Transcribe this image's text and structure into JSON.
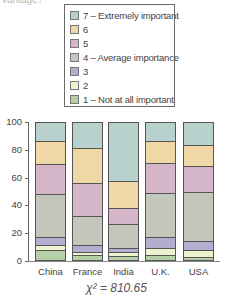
{
  "header": {
    "cut_text": "vantage?"
  },
  "legend": {
    "items": [
      {
        "label": "7 – Extremely important",
        "color": "#b9d1cc"
      },
      {
        "label": "6",
        "color": "#f0d8a6"
      },
      {
        "label": "5",
        "color": "#d5b6c8"
      },
      {
        "label": "4 – Average importance",
        "color": "#c3c6bb"
      },
      {
        "label": "3",
        "color": "#b3aed0"
      },
      {
        "label": "2",
        "color": "#eef2cf"
      },
      {
        "label": "1 – Not at all important",
        "color": "#b5d0a7"
      }
    ]
  },
  "yaxis": {
    "ticks": [
      "100",
      "80",
      "60",
      "40",
      "20",
      "0"
    ]
  },
  "footer": {
    "statistic": "χ² = 810.65"
  },
  "chart_data": {
    "type": "bar",
    "stacked": true,
    "title": "",
    "xlabel": "",
    "ylabel": "",
    "ylim": [
      0,
      100
    ],
    "yticks": [
      0,
      20,
      40,
      60,
      80,
      100
    ],
    "categories": [
      "China",
      "France",
      "India",
      "U.K.",
      "USA"
    ],
    "legend_position": "top",
    "series": [
      {
        "name": "1 – Not at all important",
        "values": [
          7,
          4,
          3,
          4,
          2
        ]
      },
      {
        "name": "2",
        "values": [
          4,
          2,
          3,
          5,
          5
        ]
      },
      {
        "name": "3",
        "values": [
          6,
          5,
          3,
          8,
          7
        ]
      },
      {
        "name": "4 – Average importance",
        "values": [
          31,
          21,
          17,
          32,
          36
        ]
      },
      {
        "name": "5",
        "values": [
          22,
          24,
          12,
          22,
          19
        ]
      },
      {
        "name": "6",
        "values": [
          17,
          26,
          20,
          16,
          15
        ]
      },
      {
        "name": "7 – Extremely important",
        "values": [
          13,
          18,
          42,
          13,
          16
        ]
      }
    ],
    "annotations": [
      "χ² = 810.65"
    ]
  }
}
